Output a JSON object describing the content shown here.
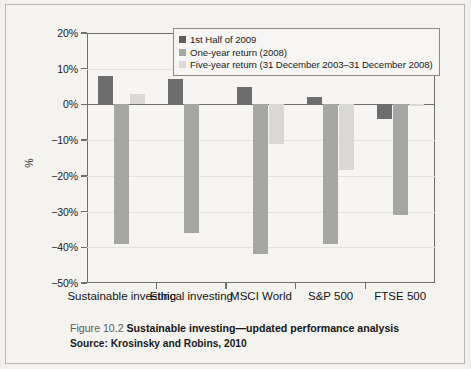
{
  "figure": {
    "caption_number": "Figure 10.2",
    "caption_text": "Sustainable investing—updated performance analysis",
    "source": "Source: Krosinsky and Robins, 2010"
  },
  "legend": {
    "position": "top-center",
    "entries": [
      {
        "label": "1st Half of 2009",
        "color": "#5f5f5f"
      },
      {
        "label": "One-year return (2008)",
        "color": "#a6a6a4"
      },
      {
        "label": "Five-year return (31 December 2003–31 December 2008)",
        "color": "#dcdbd7"
      }
    ]
  },
  "axes": {
    "ylabel": "%",
    "yticks": [
      "20%",
      "10%",
      "0%",
      "-10%",
      "-20%",
      "-30%",
      "-40%",
      "-50%"
    ],
    "ytick_values": [
      20,
      10,
      0,
      -10,
      -20,
      -30,
      -40,
      -50
    ]
  },
  "chart_data": {
    "type": "bar",
    "title": "Sustainable investing—updated performance analysis",
    "xlabel": "",
    "ylabel": "%",
    "ylim": [
      -50,
      20
    ],
    "grid": true,
    "legend_position": "top-center",
    "categories": [
      "Sustainable investing",
      "Ethical investing",
      "MSCI World",
      "S&P 500",
      "FTSE 500"
    ],
    "series": [
      {
        "name": "1st Half of 2009",
        "color": "#6d6d6d",
        "values": [
          8,
          7,
          5,
          2,
          -4
        ]
      },
      {
        "name": "One-year return (2008)",
        "color": "#a6a6a4",
        "values": [
          -39,
          -36,
          -42,
          -39,
          -31
        ]
      },
      {
        "name": "Five-year return (31 December 2003–31 December 2008)",
        "color": "#d9d8d4",
        "values": [
          3,
          0,
          -11,
          -18.5,
          -0.5
        ]
      }
    ]
  }
}
